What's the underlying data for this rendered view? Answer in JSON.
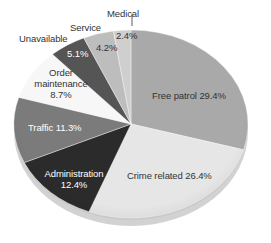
{
  "chart_data": {
    "type": "pie",
    "title": "",
    "style": "3d-exploded-none",
    "slices": [
      {
        "label": "Free patrol",
        "value": 29.4,
        "color": "#a9a9a9"
      },
      {
        "label": "Crime related",
        "value": 26.4,
        "color": "#e6e6e6"
      },
      {
        "label": "Administration",
        "value": 12.4,
        "color": "#2b2b2b"
      },
      {
        "label": "Traffic",
        "value": 11.3,
        "color": "#7b7b7b"
      },
      {
        "label": "Order maintenance",
        "value": 8.7,
        "color": "#f7f7f7"
      },
      {
        "label": "Unavailable",
        "value": 5.1,
        "color": "#555555"
      },
      {
        "label": "Service",
        "value": 4.2,
        "color": "#bdbdbd"
      },
      {
        "label": "Medical",
        "value": 2.4,
        "color": "#cfcfcf"
      }
    ]
  },
  "labels": {
    "free_patrol": "Free patrol 29.4%",
    "crime_related": "Crime related 26.4%",
    "administration": "Administration",
    "administration_pct": "12.4%",
    "traffic": "Traffic 11.3%",
    "order": "Order",
    "maintenance": "maintenance",
    "order_pct": "8.7%",
    "unavailable": "Unavailable",
    "unavailable_pct": "5.1%",
    "service": "Service",
    "service_pct": "4.2%",
    "medical": "Medical",
    "medical_pct": "2.4%"
  }
}
